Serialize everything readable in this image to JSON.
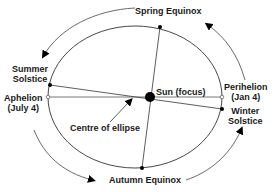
{
  "diagram": {
    "colors": {
      "line": "#333333",
      "dot": "#000000",
      "text": "#1a1a1a",
      "background": "#ffffff"
    },
    "labels": {
      "spring_equinox": "Spring Equinox",
      "summer_solstice_1": "Summer",
      "summer_solstice_2": "Solstice",
      "aphelion_1": "Aphelion",
      "aphelion_2": "(July 4)",
      "sun": "Sun (focus)",
      "perihelion_1": "Perihelion",
      "perihelion_2": "(Jan 4)",
      "winter_solstice_1": "Winter",
      "winter_solstice_2": "Solstice",
      "centre": "Centre of ellipse",
      "autumn_equinox": "Autumn Equinox"
    }
  }
}
